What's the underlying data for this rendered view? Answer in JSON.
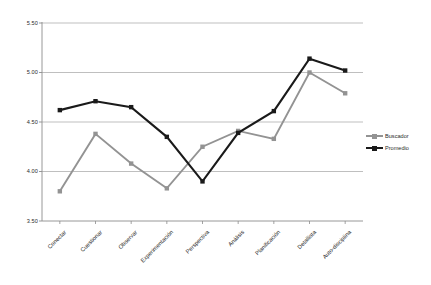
{
  "chart_data": {
    "type": "line",
    "title": "",
    "xlabel": "",
    "ylabel": "",
    "categories": [
      "Conectar",
      "Cuestionar",
      "Observar",
      "Experimentación",
      "Perspectiva",
      "Análisis",
      "Planificación",
      "Detallista",
      "Auto-disciplina"
    ],
    "ylim": [
      3.5,
      5.5
    ],
    "yticks": [
      "3.50",
      "4.00",
      "4.50",
      "5.00",
      "5.50"
    ],
    "ytick_values": [
      3.5,
      4.0,
      4.5,
      5.0,
      5.5
    ],
    "grid": "horizontal",
    "legend_position": "right",
    "series": [
      {
        "name": "Buscador",
        "color": "#939393",
        "marker": "square",
        "values": [
          3.8,
          4.38,
          4.08,
          3.83,
          4.25,
          4.41,
          4.33,
          5.0,
          4.79
        ]
      },
      {
        "name": "Promedio",
        "color": "#1a1a1a",
        "marker": "square",
        "values": [
          4.62,
          4.71,
          4.65,
          4.35,
          3.9,
          4.39,
          4.61,
          5.14,
          5.02
        ]
      }
    ]
  },
  "legend": {
    "items": [
      {
        "label": "Buscador"
      },
      {
        "label": "Promedio"
      }
    ]
  },
  "colors": {
    "grid": "#b8b8b8",
    "axis": "#8c8c8c",
    "text": "#2b2b2b",
    "series_buscador": "#939393",
    "series_promedio": "#1a1a1a",
    "background": "#ffffff"
  }
}
